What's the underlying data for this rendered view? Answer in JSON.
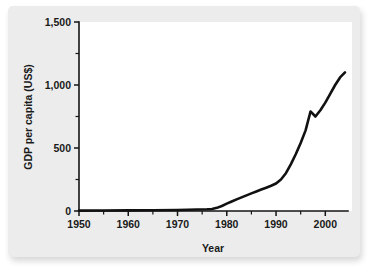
{
  "figure": {
    "background_color": "#ececec",
    "plot_background_color": "#ffffff",
    "line_color": "#111111"
  },
  "chart_data": {
    "type": "line",
    "title": "",
    "subtitle": "",
    "xlabel": "Year",
    "ylabel": "GDP per capita (US$)",
    "xlim": [
      1950,
      2004
    ],
    "ylim": [
      0,
      1500
    ],
    "grid": false,
    "legend": false,
    "legend_position": "none",
    "xticks": [
      1950,
      1960,
      1970,
      1980,
      1990,
      2000
    ],
    "xtick_labels": [
      "1950",
      "1960",
      "1970",
      "1980",
      "1990",
      "2000"
    ],
    "xminor_ticks": [
      1955,
      1965,
      1975,
      1985,
      1995
    ],
    "yticks": [
      0,
      500,
      1000,
      1500
    ],
    "ytick_labels": [
      "0",
      "500",
      "1,000",
      "1,500"
    ],
    "yminor_ticks": [
      250,
      750,
      1250
    ],
    "series": [
      {
        "name": "GDP per capita (US$)",
        "x": [
          1950,
          1955,
          1960,
          1965,
          1970,
          1972,
          1974,
          1976,
          1977,
          1978,
          1979,
          1980,
          1981,
          1982,
          1983,
          1984,
          1985,
          1986,
          1987,
          1988,
          1989,
          1990,
          1991,
          1992,
          1993,
          1994,
          1995,
          1996,
          1997,
          1998,
          1999,
          2000,
          2001,
          2002,
          2003,
          2004
        ],
        "values": [
          3,
          4,
          5,
          6,
          8,
          10,
          12,
          14,
          16,
          25,
          40,
          58,
          75,
          92,
          108,
          124,
          140,
          155,
          170,
          185,
          200,
          218,
          250,
          300,
          370,
          450,
          540,
          640,
          790,
          750,
          800,
          860,
          930,
          1000,
          1060,
          1100
        ]
      }
    ],
    "annotations": []
  }
}
